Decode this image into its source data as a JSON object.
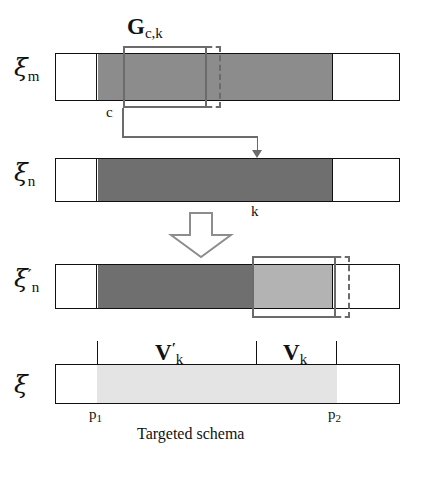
{
  "figure": {
    "caption": "Targeted schema",
    "colors": {
      "outline": "#111111",
      "gray_mid": "#8c8c8c",
      "gray_dark": "#6f6f6f",
      "gray_light": "#b3b3b3",
      "gray_pale": "#e4e4e4",
      "bracket": "#6b6b6b",
      "background": "#ffffff"
    }
  },
  "rows": [
    {
      "id": "row-xi-m",
      "symbol": "ξ",
      "subscript": "m",
      "prime": "",
      "segments": [
        {
          "name": "left-white",
          "fill": "white"
        },
        {
          "name": "gray-body",
          "fill": "gray_mid"
        },
        {
          "name": "right-white",
          "fill": "white"
        }
      ],
      "selection_label": "G",
      "selection_sub": "c,k",
      "marker_label": "c"
    },
    {
      "id": "row-xi-n",
      "symbol": "ξ",
      "subscript": "n",
      "prime": "",
      "segments": [
        {
          "name": "left-white",
          "fill": "white"
        },
        {
          "name": "gray-body",
          "fill": "gray_dark"
        },
        {
          "name": "right-white",
          "fill": "white"
        }
      ],
      "marker_label": "k"
    },
    {
      "id": "row-xi-n-prime",
      "symbol": "ξ",
      "subscript": "n",
      "prime": "′",
      "segments": [
        {
          "name": "left-white",
          "fill": "white"
        },
        {
          "name": "gray-dark-body",
          "fill": "gray_dark"
        },
        {
          "name": "gray-light-body",
          "fill": "gray_light"
        },
        {
          "name": "right-white",
          "fill": "white"
        }
      ]
    },
    {
      "id": "row-xi",
      "symbol": "ξ",
      "subscript": "",
      "prime": "",
      "segments": [
        {
          "name": "left-white",
          "fill": "white"
        },
        {
          "name": "pale-body",
          "fill": "gray_pale"
        },
        {
          "name": "right-white",
          "fill": "white"
        }
      ]
    }
  ],
  "labels": {
    "g_main": "G",
    "g_sub": "c,k",
    "c": "c",
    "k": "k",
    "v_prime_main": "V",
    "v_prime_sub": "k",
    "v_prime_mark": "′",
    "v_main": "V",
    "v_sub": "k",
    "p1_main": "p",
    "p1_sub": "1",
    "p2_main": "p",
    "p2_sub": "2",
    "caption": "Targeted schema"
  }
}
